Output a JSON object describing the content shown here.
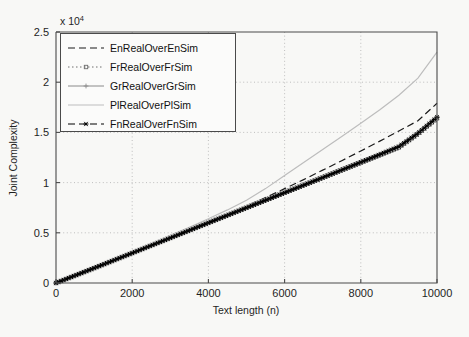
{
  "chart_data": {
    "type": "line",
    "title": "",
    "xlabel": "Text length (n)",
    "ylabel": "Joint Complexity",
    "y_exponent_label": "x 10",
    "y_exponent_power": "4",
    "xlim": [
      0,
      10000
    ],
    "ylim": [
      0,
      25000
    ],
    "xticks": [
      0,
      2000,
      4000,
      6000,
      8000,
      10000
    ],
    "xticklabels": [
      "0",
      "2000",
      "4000",
      "6000",
      "8000",
      "10000"
    ],
    "yticks": [
      0,
      5000,
      10000,
      15000,
      20000,
      25000
    ],
    "yticklabels": [
      "0",
      "0.5",
      "1",
      "1.5",
      "2",
      "2.5"
    ],
    "grid": true,
    "grid_style": "dotted",
    "legend_position": "upper-left",
    "x": [
      0,
      500,
      1000,
      1500,
      2000,
      2500,
      3000,
      3500,
      4000,
      4500,
      5000,
      5500,
      6000,
      6500,
      7000,
      7500,
      8000,
      8500,
      9000,
      9500,
      10000
    ],
    "series": [
      {
        "name": "EnRealOverEnSim",
        "color": "#1a1a1a",
        "linestyle": "dashed",
        "marker": "none",
        "values": [
          0,
          760,
          1520,
          2280,
          3040,
          3800,
          4560,
          5320,
          6080,
          6840,
          7640,
          8500,
          9400,
          10300,
          11240,
          12180,
          13150,
          14130,
          15140,
          16160,
          17900
        ]
      },
      {
        "name": "FrRealOverFrSim",
        "color": "#6e6e6e",
        "linestyle": "dotted",
        "marker": "square",
        "values": [
          0,
          740,
          1480,
          2230,
          2980,
          3730,
          4480,
          5230,
          5980,
          6730,
          7480,
          8230,
          8980,
          9730,
          10480,
          11230,
          11980,
          12730,
          13500,
          14850,
          16400
        ]
      },
      {
        "name": "GrRealOverGrSim",
        "color": "#8a8a8a",
        "linestyle": "solid",
        "marker": "plus",
        "values": [
          0,
          755,
          1510,
          2265,
          3020,
          3775,
          4530,
          5285,
          6040,
          6795,
          7550,
          8305,
          9060,
          9815,
          10570,
          11325,
          12080,
          12835,
          13620,
          14960,
          16550
        ]
      },
      {
        "name": "PlRealOverPlSim",
        "color": "#bdbdbd",
        "linestyle": "solid",
        "marker": "none",
        "values": [
          0,
          780,
          1560,
          2350,
          3140,
          3940,
          4740,
          5560,
          6400,
          7280,
          8250,
          9400,
          10700,
          12000,
          13300,
          14600,
          15900,
          17250,
          18700,
          20400,
          23000
        ]
      },
      {
        "name": "FnRealOverFnSim",
        "color": "#000000",
        "linestyle": "dashed",
        "marker": "star",
        "values": [
          0,
          745,
          1490,
          2240,
          2990,
          3740,
          4490,
          5240,
          5990,
          6740,
          7490,
          8240,
          8990,
          9740,
          10500,
          11260,
          12030,
          12800,
          13580,
          14900,
          16500
        ]
      }
    ]
  },
  "legend": {
    "items": [
      {
        "label": "EnRealOverEnSim"
      },
      {
        "label": "FrRealOverFrSim"
      },
      {
        "label": "GrRealOverGrSim"
      },
      {
        "label": "PlRealOverPlSim"
      },
      {
        "label": "FnRealOverFnSim"
      }
    ]
  }
}
